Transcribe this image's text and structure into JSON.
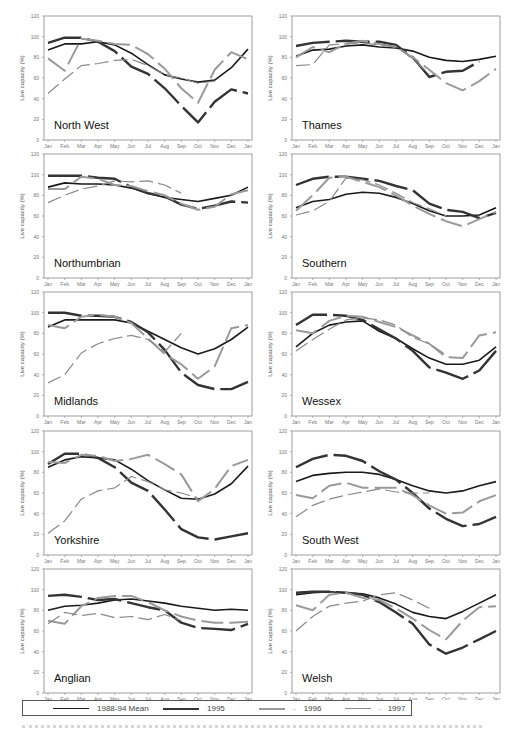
{
  "figure": {
    "y_axis_label": "Live capacity (%)",
    "y_ticks": [
      0,
      20,
      40,
      60,
      80,
      100,
      120
    ],
    "x_ticks": [
      "Jan",
      "Feb",
      "Mar",
      "Apr",
      "May",
      "Jun",
      "Jul",
      "Aug",
      "Sep",
      "Oct",
      "Nov",
      "Dec",
      "Jan"
    ]
  },
  "legend": {
    "items": [
      {
        "label": "1988-94 Mean",
        "style": "mean"
      },
      {
        "label": "1995",
        "style": "y1995"
      },
      {
        "label": "1996",
        "style": "y1996"
      },
      {
        "label": "1997",
        "style": "y1997"
      }
    ]
  },
  "series_styles": {
    "mean": {
      "color": "#1a1a1a",
      "width": 1.6,
      "dash": ""
    },
    "y1995": {
      "color": "#333333",
      "width": 2.4,
      "dash": "34,6"
    },
    "y1996": {
      "color": "#9a9a9a",
      "width": 2.0,
      "dash": "22,6"
    },
    "y1997": {
      "color": "#8a8a8a",
      "width": 1.2,
      "dash": "14,5"
    }
  },
  "chart_data": [
    {
      "type": "line",
      "title": "North West",
      "xlabel": "",
      "ylabel": "Live capacity (%)",
      "ylim": [
        0,
        120
      ],
      "categories": [
        "Jan",
        "Feb",
        "Mar",
        "Apr",
        "May",
        "Jun",
        "Jul",
        "Aug",
        "Sep",
        "Oct",
        "Nov",
        "Dec",
        "Jan"
      ],
      "series": [
        {
          "name": "1988-94 Mean",
          "values": [
            87,
            93,
            93,
            95,
            92,
            84,
            73,
            63,
            59,
            56,
            58,
            70,
            88
          ]
        },
        {
          "name": "1995",
          "values": [
            94,
            99,
            99,
            95,
            86,
            71,
            64,
            50,
            33,
            17,
            37,
            49,
            45
          ]
        },
        {
          "name": "1996",
          "values": [
            79,
            67,
            98,
            96,
            93,
            92,
            83,
            69,
            50,
            36,
            68,
            85,
            78
          ]
        },
        {
          "name": "1997",
          "values": [
            45,
            59,
            72,
            74,
            77,
            78,
            72,
            63,
            60,
            55,
            57,
            null,
            null
          ]
        }
      ]
    },
    {
      "type": "line",
      "title": "Thames",
      "xlabel": "",
      "ylabel": "Live capacity (%)",
      "ylim": [
        0,
        120
      ],
      "categories": [
        "Jan",
        "Feb",
        "Mar",
        "Apr",
        "May",
        "Jun",
        "Jul",
        "Aug",
        "Sep",
        "Oct",
        "Nov",
        "Dec",
        "Jan"
      ],
      "series": [
        {
          "name": "1988-94 Mean",
          "values": [
            81,
            87,
            88,
            91,
            92,
            90,
            89,
            86,
            80,
            77,
            76,
            78,
            81
          ]
        },
        {
          "name": "1995",
          "values": [
            91,
            94,
            95,
            96,
            95,
            95,
            92,
            80,
            61,
            66,
            67,
            76,
            null
          ]
        },
        {
          "name": "1996",
          "values": [
            80,
            90,
            85,
            93,
            96,
            93,
            90,
            80,
            68,
            55,
            48,
            57,
            69
          ]
        },
        {
          "name": "1997",
          "values": [
            72,
            73,
            92,
            93,
            94,
            92,
            91,
            78,
            64,
            null,
            null,
            null,
            null
          ]
        }
      ]
    },
    {
      "type": "line",
      "title": "Northumbrian",
      "xlabel": "",
      "ylabel": "Live capacity (%)",
      "ylim": [
        0,
        120
      ],
      "categories": [
        "Jan",
        "Feb",
        "Mar",
        "Apr",
        "May",
        "Jun",
        "Jul",
        "Aug",
        "Sep",
        "Oct",
        "Nov",
        "Dec",
        "Jan"
      ],
      "series": [
        {
          "name": "1988-94 Mean",
          "values": [
            88,
            92,
            91,
            91,
            90,
            87,
            82,
            78,
            76,
            74,
            77,
            80,
            88
          ]
        },
        {
          "name": "1995",
          "values": [
            99,
            99,
            99,
            97,
            96,
            88,
            82,
            79,
            71,
            67,
            70,
            74,
            73
          ]
        },
        {
          "name": "1996",
          "values": [
            86,
            86,
            98,
            96,
            90,
            89,
            84,
            80,
            72,
            66,
            69,
            81,
            85
          ]
        },
        {
          "name": "1997",
          "values": [
            73,
            80,
            86,
            89,
            94,
            93,
            94,
            90,
            82,
            null,
            null,
            null,
            null
          ]
        }
      ]
    },
    {
      "type": "line",
      "title": "Southern",
      "xlabel": "",
      "ylabel": "Live capacity (%)",
      "ylim": [
        0,
        120
      ],
      "categories": [
        "Jan",
        "Feb",
        "Mar",
        "Apr",
        "May",
        "Jun",
        "Jul",
        "Aug",
        "Sep",
        "Oct",
        "Nov",
        "Dec",
        "Jan"
      ],
      "series": [
        {
          "name": "1988-94 Mean",
          "values": [
            68,
            74,
            76,
            81,
            83,
            82,
            78,
            72,
            65,
            60,
            60,
            61,
            68
          ]
        },
        {
          "name": "1995",
          "values": [
            90,
            96,
            98,
            98,
            96,
            94,
            89,
            85,
            72,
            66,
            64,
            58,
            63
          ]
        },
        {
          "name": "1996",
          "values": [
            65,
            80,
            97,
            98,
            93,
            88,
            80,
            70,
            62,
            55,
            50,
            57,
            64
          ]
        },
        {
          "name": "1997",
          "values": [
            61,
            65,
            74,
            97,
            95,
            90,
            82,
            73,
            67,
            60,
            null,
            null,
            null
          ]
        }
      ]
    },
    {
      "type": "line",
      "title": "Midlands",
      "xlabel": "",
      "ylabel": "Live capacity (%)",
      "ylim": [
        0,
        120
      ],
      "categories": [
        "Jan",
        "Feb",
        "Mar",
        "Apr",
        "May",
        "Jun",
        "Jul",
        "Aug",
        "Sep",
        "Oct",
        "Nov",
        "Dec",
        "Jan"
      ],
      "series": [
        {
          "name": "1988-94 Mean",
          "values": [
            86,
            93,
            93,
            93,
            93,
            90,
            82,
            74,
            66,
            60,
            65,
            74,
            86
          ]
        },
        {
          "name": "1995",
          "values": [
            100,
            100,
            97,
            97,
            96,
            91,
            81,
            64,
            42,
            30,
            26,
            26,
            33
          ]
        },
        {
          "name": "1996",
          "values": [
            88,
            85,
            96,
            98,
            96,
            90,
            75,
            60,
            50,
            36,
            48,
            85,
            88
          ]
        },
        {
          "name": "1997",
          "values": [
            32,
            40,
            61,
            70,
            75,
            78,
            74,
            62,
            80,
            null,
            null,
            null,
            null
          ]
        }
      ]
    },
    {
      "type": "line",
      "title": "Wessex",
      "xlabel": "",
      "ylabel": "Live capacity (%)",
      "ylim": [
        0,
        120
      ],
      "categories": [
        "Jan",
        "Feb",
        "Mar",
        "Apr",
        "May",
        "Jun",
        "Jul",
        "Aug",
        "Sep",
        "Oct",
        "Nov",
        "Dec",
        "Jan"
      ],
      "series": [
        {
          "name": "1988-94 Mean",
          "values": [
            67,
            80,
            88,
            91,
            92,
            82,
            75,
            65,
            56,
            50,
            50,
            54,
            67
          ]
        },
        {
          "name": "1995",
          "values": [
            88,
            98,
            98,
            97,
            93,
            84,
            75,
            63,
            47,
            42,
            36,
            44,
            63
          ]
        },
        {
          "name": "1996",
          "values": [
            83,
            80,
            92,
            97,
            96,
            91,
            86,
            78,
            70,
            57,
            56,
            78,
            81
          ]
        },
        {
          "name": "1997",
          "values": [
            63,
            74,
            84,
            93,
            95,
            93,
            88,
            76,
            70,
            59,
            null,
            null,
            null
          ]
        }
      ]
    },
    {
      "type": "line",
      "title": "Yorkshire",
      "xlabel": "",
      "ylabel": "Live capacity (%)",
      "ylim": [
        0,
        120
      ],
      "categories": [
        "Jan",
        "Feb",
        "Mar",
        "Apr",
        "May",
        "Jun",
        "Jul",
        "Aug",
        "Sep",
        "Oct",
        "Nov",
        "Dec",
        "Jan"
      ],
      "series": [
        {
          "name": "1988-94 Mean",
          "values": [
            85,
            92,
            95,
            94,
            92,
            83,
            72,
            63,
            55,
            54,
            59,
            69,
            86
          ]
        },
        {
          "name": "1995",
          "values": [
            88,
            98,
            98,
            94,
            85,
            70,
            62,
            44,
            25,
            17,
            15,
            18,
            21
          ]
        },
        {
          "name": "1996",
          "values": [
            90,
            89,
            97,
            96,
            91,
            93,
            97,
            88,
            78,
            52,
            64,
            86,
            92
          ]
        },
        {
          "name": "1997",
          "values": [
            21,
            33,
            54,
            62,
            65,
            76,
            71,
            63,
            60,
            55,
            null,
            null,
            null
          ]
        }
      ]
    },
    {
      "type": "line",
      "title": "South West",
      "xlabel": "",
      "ylabel": "Live capacity (%)",
      "ylim": [
        0,
        120
      ],
      "categories": [
        "Jan",
        "Feb",
        "Mar",
        "Apr",
        "May",
        "Jun",
        "Jul",
        "Aug",
        "Sep",
        "Oct",
        "Nov",
        "Dec",
        "Jan"
      ],
      "series": [
        {
          "name": "1988-94 Mean",
          "values": [
            71,
            77,
            79,
            80,
            80,
            78,
            73,
            67,
            62,
            60,
            62,
            67,
            71
          ]
        },
        {
          "name": "1995",
          "values": [
            85,
            93,
            97,
            96,
            91,
            81,
            73,
            60,
            45,
            35,
            28,
            30,
            37
          ]
        },
        {
          "name": "1996",
          "values": [
            58,
            55,
            67,
            70,
            65,
            65,
            65,
            58,
            48,
            40,
            41,
            52,
            58
          ]
        },
        {
          "name": "1997",
          "values": [
            37,
            48,
            54,
            58,
            61,
            64,
            61,
            60,
            60,
            null,
            null,
            null,
            null
          ]
        }
      ]
    },
    {
      "type": "line",
      "title": "Anglian",
      "xlabel": "",
      "ylabel": "Live capacity (%)",
      "ylim": [
        0,
        120
      ],
      "categories": [
        "Jan",
        "Feb",
        "Mar",
        "Apr",
        "May",
        "Jun",
        "Jul",
        "Aug",
        "Sep",
        "Oct",
        "Nov",
        "Dec",
        "Jan"
      ],
      "series": [
        {
          "name": "1988-94 Mean",
          "values": [
            80,
            84,
            85,
            87,
            90,
            91,
            89,
            87,
            84,
            82,
            80,
            81,
            80
          ]
        },
        {
          "name": "1995",
          "values": [
            94,
            95,
            93,
            90,
            91,
            87,
            83,
            80,
            68,
            63,
            62,
            61,
            67
          ]
        },
        {
          "name": "1996",
          "values": [
            70,
            67,
            84,
            92,
            94,
            94,
            88,
            80,
            74,
            70,
            68,
            68,
            69
          ]
        },
        {
          "name": "1997",
          "values": [
            67,
            78,
            75,
            77,
            73,
            74,
            71,
            76,
            70,
            null,
            null,
            null,
            null
          ]
        }
      ]
    },
    {
      "type": "line",
      "title": "Welsh",
      "xlabel": "",
      "ylabel": "Live capacity (%)",
      "ylim": [
        0,
        120
      ],
      "categories": [
        "Jan",
        "Feb",
        "Mar",
        "Apr",
        "May",
        "Jun",
        "Jul",
        "Aug",
        "Sep",
        "Oct",
        "Nov",
        "Dec",
        "Jan"
      ],
      "series": [
        {
          "name": "1988-94 Mean",
          "values": [
            95,
            97,
            98,
            97,
            96,
            92,
            86,
            78,
            74,
            72,
            79,
            87,
            95
          ]
        },
        {
          "name": "1995",
          "values": [
            97,
            98,
            98,
            97,
            95,
            88,
            78,
            67,
            47,
            38,
            44,
            52,
            60
          ]
        },
        {
          "name": "1996",
          "values": [
            85,
            80,
            95,
            97,
            92,
            90,
            82,
            72,
            61,
            52,
            70,
            83,
            84
          ]
        },
        {
          "name": "1997",
          "values": [
            60,
            74,
            84,
            87,
            89,
            95,
            97,
            90,
            82,
            null,
            null,
            null,
            null
          ]
        }
      ]
    }
  ]
}
